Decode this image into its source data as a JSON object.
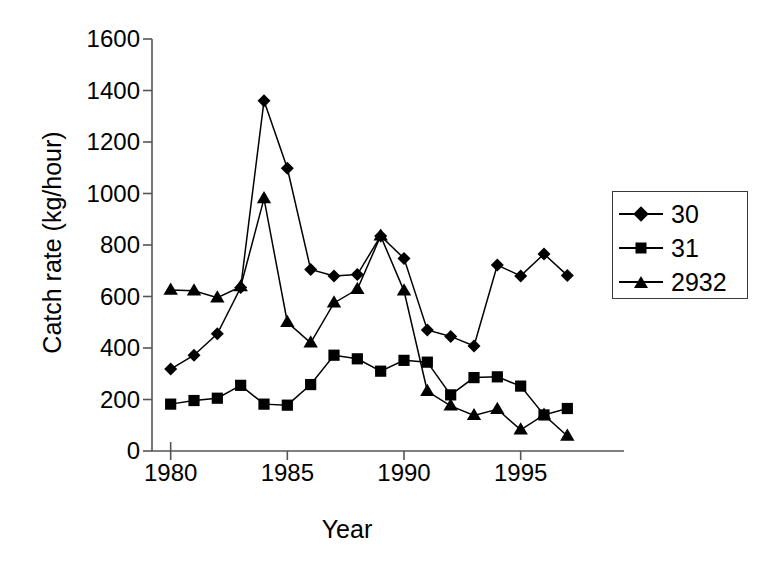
{
  "chart_data": {
    "type": "line",
    "title": "",
    "xlabel": "Year",
    "ylabel": "Catch rate (kg/hour)",
    "x": [
      1980,
      1981,
      1982,
      1983,
      1984,
      1985,
      1986,
      1987,
      1988,
      1989,
      1990,
      1991,
      1992,
      1993,
      1994,
      1995,
      1996,
      1997
    ],
    "xlim": [
      1979.2,
      1997.8
    ],
    "ylim": [
      0,
      1600
    ],
    "xticks": [
      1980,
      1985,
      1990,
      1995
    ],
    "xtick_labels": [
      "1980",
      "1985",
      "1990",
      "1995"
    ],
    "yticks": [
      0,
      200,
      400,
      600,
      800,
      1000,
      1200,
      1400,
      1600
    ],
    "ytick_labels": [
      "0",
      "200",
      "400",
      "600",
      "800",
      "1000",
      "1200",
      "1400",
      "1600"
    ],
    "grid": false,
    "legend_position": "right",
    "series": [
      {
        "name": "30",
        "marker": "diamond",
        "color": "#000000",
        "values": [
          318,
          372,
          455,
          635,
          1360,
          1098,
          705,
          680,
          685,
          835,
          748,
          470,
          445,
          408,
          722,
          680,
          765,
          682
        ]
      },
      {
        "name": "31",
        "marker": "square",
        "color": "#000000",
        "values": [
          182,
          196,
          205,
          255,
          182,
          178,
          258,
          372,
          358,
          310,
          352,
          345,
          218,
          285,
          288,
          252,
          140,
          165
        ]
      },
      {
        "name": "2932",
        "marker": "triangle",
        "color": "#000000",
        "values": [
          625,
          622,
          595,
          638,
          980,
          500,
          420,
          575,
          628,
          835,
          622,
          232,
          175,
          138,
          162,
          82,
          140,
          58
        ]
      }
    ]
  },
  "legend": {
    "items": [
      {
        "label": "30",
        "marker": "diamond"
      },
      {
        "label": "31",
        "marker": "square"
      },
      {
        "label": "2932",
        "marker": "triangle"
      }
    ]
  },
  "axes": {
    "x_title": "Year",
    "y_title": "Catch rate (kg/hour)"
  }
}
